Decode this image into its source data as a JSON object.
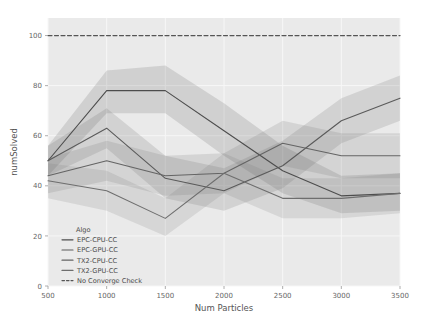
{
  "chart_data": {
    "type": "line",
    "title": "",
    "xlabel": "Num Particles",
    "ylabel": "numSolved",
    "xlim": [
      500,
      3500
    ],
    "ylim": [
      0,
      107
    ],
    "xticks": [
      500,
      1000,
      1500,
      2000,
      2500,
      3000,
      3500
    ],
    "xtick_labels": [
      "500",
      "1000",
      "1500",
      "2000",
      "2500",
      "3000",
      "3500"
    ],
    "yticks": [
      0,
      20,
      40,
      60,
      80,
      100
    ],
    "ytick_labels": [
      "0",
      "20",
      "40",
      "60",
      "80",
      "100"
    ],
    "grid": true,
    "legend_position": "lower left",
    "legend_title": "Algo",
    "x": [
      500,
      1000,
      1500,
      2000,
      2500,
      3000,
      3500
    ],
    "series": [
      {
        "name": "EPC-CPU-CC",
        "color": "#4d4d4d",
        "style": "solid",
        "values": [
          50,
          78,
          78,
          62,
          46,
          36,
          37
        ],
        "band_lower": [
          44,
          69,
          69,
          52,
          37,
          29,
          30
        ],
        "band_upper": [
          56,
          86,
          88,
          73,
          56,
          44,
          45
        ]
      },
      {
        "name": "EPC-GPU-CC",
        "color": "#5a5a5a",
        "style": "solid",
        "values": [
          50,
          63,
          43,
          38,
          48,
          66,
          75
        ],
        "band_lower": [
          44,
          55,
          35,
          30,
          39,
          57,
          66
        ],
        "band_upper": [
          56,
          71,
          52,
          47,
          58,
          75,
          84
        ]
      },
      {
        "name": "TX2-CPU-CC",
        "color": "#646464",
        "style": "solid",
        "values": [
          44,
          50,
          44,
          45,
          57,
          52,
          52
        ],
        "band_lower": [
          37,
          42,
          36,
          37,
          48,
          43,
          43
        ],
        "band_upper": [
          51,
          58,
          52,
          53,
          66,
          61,
          61
        ]
      },
      {
        "name": "TX2-GPU-CC",
        "color": "#6e6e6e",
        "style": "solid",
        "values": [
          42,
          38,
          27,
          45,
          35,
          35,
          37
        ],
        "band_lower": [
          35,
          30,
          20,
          37,
          27,
          27,
          29
        ],
        "band_upper": [
          49,
          46,
          35,
          53,
          43,
          43,
          45
        ]
      },
      {
        "name": "No Converge Check",
        "color": "#555555",
        "style": "dashed",
        "values": [
          100,
          100,
          100,
          100,
          100,
          100,
          100
        ]
      }
    ]
  },
  "legend": {
    "title": "Algo",
    "entries": [
      {
        "label": "EPC-CPU-CC",
        "style": "solid"
      },
      {
        "label": "EPC-GPU-CC",
        "style": "solid"
      },
      {
        "label": "TX2-CPU-CC",
        "style": "solid"
      },
      {
        "label": "TX2-GPU-CC",
        "style": "solid"
      },
      {
        "label": "No Converge Check",
        "style": "dashed"
      }
    ]
  },
  "colors": {
    "plot_background": "#eaeaea",
    "figure_background": "#ffffff",
    "grid": "#f7f7f7",
    "tick_text": "#666666",
    "axis_text": "#555555"
  }
}
